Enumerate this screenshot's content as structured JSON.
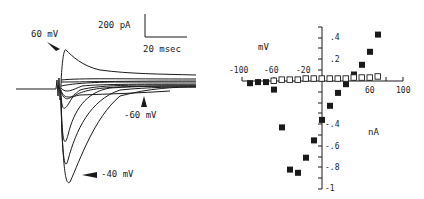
{
  "chart_data": [
    {
      "type": "line",
      "title": "",
      "description": "Whole-cell current traces in response to voltage steps",
      "scale_bar": {
        "current_label": "200 pA",
        "time_label": "20 msec"
      },
      "annotations": [
        {
          "text": "60 mV",
          "note": "outward peak trace"
        },
        {
          "text": "-60 mV",
          "note": "small inward trace"
        },
        {
          "text": "-40 mV",
          "note": "largest inward peak trace"
        }
      ],
      "series_count": 9
    },
    {
      "type": "scatter",
      "title": "",
      "xlabel": "mV",
      "ylabel": "nA",
      "x_ticks": [
        "-100",
        "-60",
        "-20",
        "60",
        "100"
      ],
      "y_ticks": [
        ".4",
        ".2",
        "-.4",
        "-.6",
        "-.8",
        "-1"
      ],
      "xlim": [
        -100,
        100
      ],
      "ylim": [
        -1,
        0.5
      ],
      "grid": false,
      "series": [
        {
          "name": "filled squares (peak current)",
          "marker": "filled-square",
          "points": [
            [
              -90,
              -0.02
            ],
            [
              -80,
              -0.01
            ],
            [
              -70,
              -0.01
            ],
            [
              -60,
              -0.08
            ],
            [
              -50,
              -0.43
            ],
            [
              -40,
              -0.82
            ],
            [
              -30,
              -0.85
            ],
            [
              -20,
              -0.71
            ],
            [
              -10,
              -0.55
            ],
            [
              0,
              -0.36
            ],
            [
              10,
              -0.23
            ],
            [
              20,
              -0.11
            ],
            [
              30,
              -0.03
            ],
            [
              40,
              0.06
            ],
            [
              50,
              0.15
            ],
            [
              60,
              0.27
            ],
            [
              70,
              0.43
            ]
          ]
        },
        {
          "name": "open squares (steady-state current)",
          "marker": "open-square",
          "points": [
            [
              -60,
              0.0
            ],
            [
              -50,
              0.01
            ],
            [
              -40,
              0.01
            ],
            [
              -30,
              0.01
            ],
            [
              -20,
              0.02
            ],
            [
              -10,
              0.02
            ],
            [
              0,
              0.02
            ],
            [
              10,
              0.02
            ],
            [
              20,
              0.02
            ],
            [
              30,
              0.02
            ],
            [
              40,
              0.03
            ],
            [
              50,
              0.03
            ],
            [
              60,
              0.03
            ],
            [
              70,
              0.04
            ]
          ]
        }
      ]
    }
  ]
}
